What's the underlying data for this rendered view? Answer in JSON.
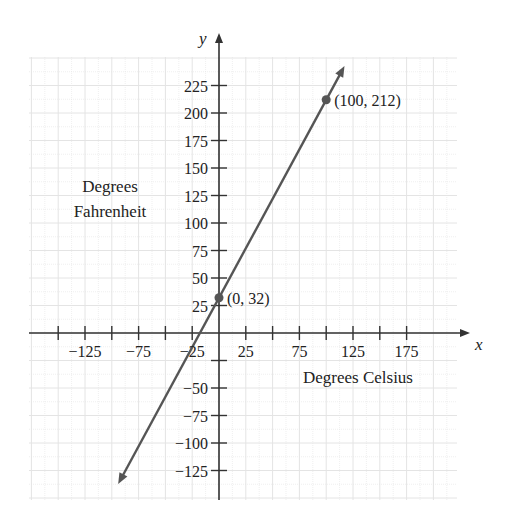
{
  "chart_data": {
    "type": "line",
    "title": "",
    "xlabel": "Degrees Celsius",
    "ylabel_lines": [
      "Degrees",
      "Fahrenheit"
    ],
    "x_axis_letter": "x",
    "y_axis_letter": "y",
    "xlim": [
      -150,
      215
    ],
    "ylim": [
      -140,
      250
    ],
    "grid": true,
    "x_ticks": [
      -125,
      -100,
      -75,
      -50,
      -25,
      25,
      50,
      75,
      100,
      125,
      150,
      175
    ],
    "x_tick_labels": [
      {
        "value": -125,
        "label": "−125"
      },
      {
        "value": -75,
        "label": "−75"
      },
      {
        "value": -25,
        "label": "−25"
      },
      {
        "value": 25,
        "label": "25"
      },
      {
        "value": 75,
        "label": "75"
      },
      {
        "value": 125,
        "label": "125"
      },
      {
        "value": 175,
        "label": "175"
      }
    ],
    "y_tick_labels": [
      {
        "value": 225,
        "label": "225"
      },
      {
        "value": 200,
        "label": "200"
      },
      {
        "value": 175,
        "label": "175"
      },
      {
        "value": 150,
        "label": "150"
      },
      {
        "value": 125,
        "label": "125"
      },
      {
        "value": 100,
        "label": "100"
      },
      {
        "value": 75,
        "label": "75"
      },
      {
        "value": 50,
        "label": "50"
      },
      {
        "value": 25,
        "label": "25"
      },
      {
        "value": -50,
        "label": "−50"
      },
      {
        "value": -75,
        "label": "−75"
      },
      {
        "value": -100,
        "label": "−100"
      },
      {
        "value": -125,
        "label": "−125"
      }
    ],
    "y_tick_marks_only": [
      -25
    ],
    "series": [
      {
        "name": "F = 9/5 C + 32",
        "equation": "F = 1.8C + 32",
        "slope": 1.8,
        "intercept": 32,
        "x_start": -90,
        "x_end": 113,
        "arrows": "both",
        "color": "#555555"
      }
    ],
    "points": [
      {
        "x": 0,
        "y": 32,
        "label": "(0, 32)"
      },
      {
        "x": 100,
        "y": 212,
        "label": "(100, 212)"
      }
    ]
  },
  "colors": {
    "grid": "#e4e4e4",
    "axis": "#333333",
    "line": "#555555",
    "text": "#222222"
  }
}
